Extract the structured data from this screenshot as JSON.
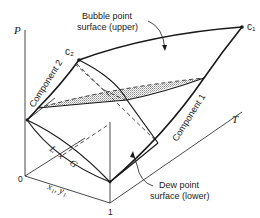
{
  "diagram": {
    "type": "3D P-T-x phase diagram of a binary mixture",
    "axes": {
      "p_label": "P",
      "t_label": "T",
      "x_label": "x₁, y₁",
      "origin_tick": "0",
      "one_tick": "1"
    },
    "critical_points": {
      "c1": "c₁",
      "c2": "c₂"
    },
    "curves": {
      "component_1": "Component 1",
      "component_2": "Component 2"
    },
    "surfaces": {
      "bubble_line1": "Bubble point",
      "bubble_line2": "surface (upper)",
      "dew_line1": "Dew point",
      "dew_line2": "surface (lower)"
    },
    "region": {
      "l": "L",
      "plus": "+",
      "g": "G"
    }
  }
}
